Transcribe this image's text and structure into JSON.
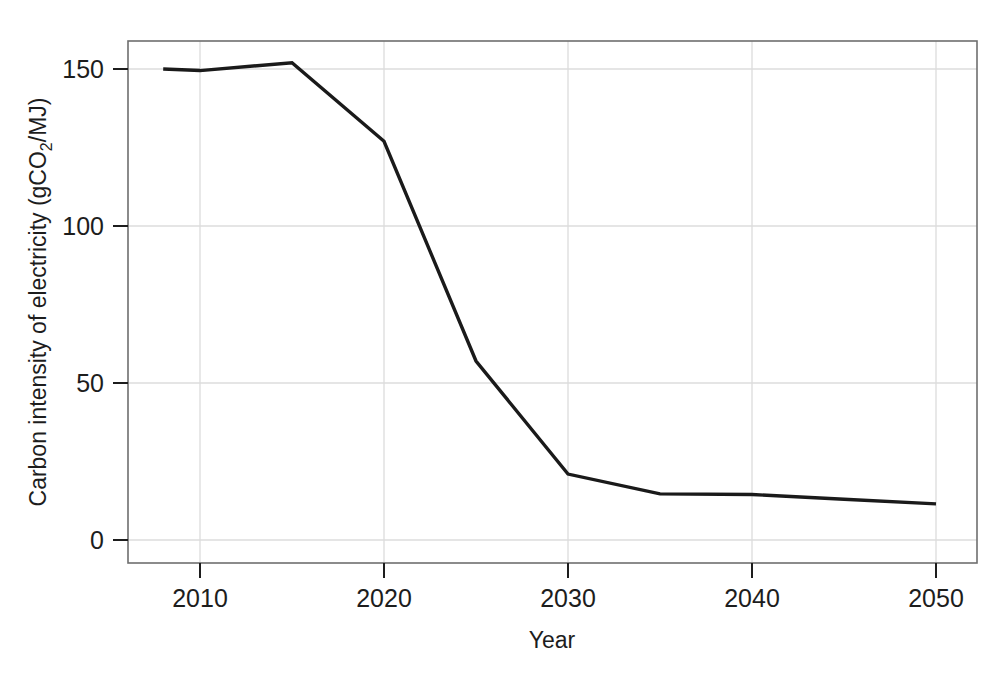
{
  "chart_data": {
    "type": "line",
    "title": "",
    "xlabel": "Year",
    "ylabel_parts": {
      "pre": "Carbon intensity of electricity (gCO",
      "sub": "2",
      "post": "/MJ)"
    },
    "ylabel": "Carbon intensity of electricity (gCO2/MJ)",
    "x": [
      2008,
      2010,
      2015,
      2020,
      2025,
      2030,
      2035,
      2040,
      2045,
      2050
    ],
    "values": [
      150,
      149.5,
      152,
      127,
      57,
      21,
      14.7,
      14.5,
      13,
      11.5
    ],
    "series": [
      {
        "name": "Carbon intensity of electricity",
        "values": [
          150,
          149.5,
          152,
          127,
          57,
          21,
          14.7,
          14.5,
          13,
          11.5
        ]
      }
    ],
    "xticks": [
      2010,
      2020,
      2030,
      2040,
      2050
    ],
    "xtick_labels": [
      "2010",
      "2020",
      "2030",
      "2040",
      "2050"
    ],
    "yticks": [
      0,
      50,
      100,
      150
    ],
    "ytick_labels": [
      "0",
      "50",
      "100",
      "150"
    ],
    "xlim": [
      2006.1,
      2052.2
    ],
    "ylim": [
      -7.3,
      159.0
    ],
    "grid": true,
    "legend": "none",
    "line_color": "#1a1a1a",
    "grid_color": "#d8d8d8",
    "frame_color": "#707070",
    "background_color": "#ffffff"
  }
}
